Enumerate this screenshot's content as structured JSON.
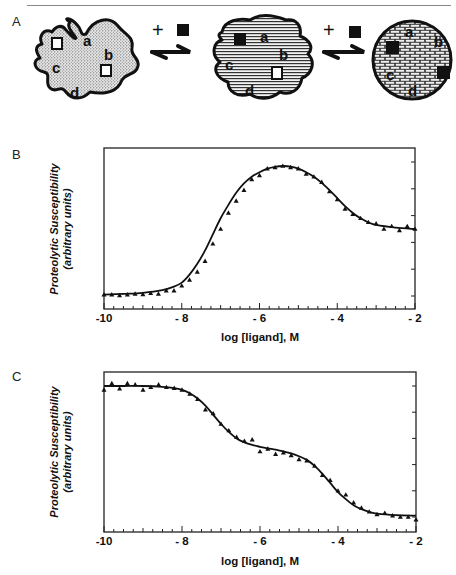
{
  "figure": {
    "panels": {
      "A": {
        "label": "A",
        "plus_sign": "+",
        "states": [
          {
            "name": "unliganded",
            "fill": "stipple",
            "sites": [
              "a",
              "b",
              "c",
              "d"
            ],
            "bound": 0
          },
          {
            "name": "partially-liganded",
            "fill": "horizontal-lines",
            "sites": [
              "a",
              "b",
              "c",
              "d"
            ],
            "bound": 1
          },
          {
            "name": "fully-liganded",
            "fill": "brick",
            "sites": [
              "a",
              "b",
              "c",
              "d"
            ],
            "bound": 2
          }
        ]
      },
      "B": {
        "label": "B"
      },
      "C": {
        "label": "C"
      }
    }
  },
  "chart_data": [
    {
      "panel": "B",
      "type": "line",
      "title": "",
      "xlabel": "log [ligand], M",
      "ylabel": "Proteolytic Susceptibility",
      "ylabel_sub": "(arbitrary units)",
      "xlim": [
        -10,
        -2
      ],
      "ylim": [
        -0.3,
        5.5
      ],
      "x_ticks": [
        "-10",
        "- 8",
        "- 6",
        "- 4",
        "- 2"
      ],
      "y_ticks_unlabeled": [
        0,
        1,
        2,
        3,
        4,
        5
      ],
      "grid": false,
      "legend": null,
      "series": [
        {
          "name": "fit",
          "style": "solid-line",
          "x": [
            -10,
            -9.5,
            -9,
            -8.5,
            -8.2,
            -8,
            -7.8,
            -7.6,
            -7.4,
            -7.2,
            -7,
            -6.8,
            -6.6,
            -6.4,
            -6.2,
            -6,
            -5.8,
            -5.6,
            -5.4,
            -5.2,
            -5,
            -4.8,
            -4.6,
            -4.4,
            -4.2,
            -4,
            -3.8,
            -3.6,
            -3.4,
            -3.2,
            -3,
            -2.5,
            -2
          ],
          "y": [
            0.05,
            0.08,
            0.12,
            0.22,
            0.35,
            0.5,
            0.8,
            1.2,
            1.7,
            2.3,
            2.9,
            3.4,
            3.85,
            4.2,
            4.45,
            4.62,
            4.75,
            4.82,
            4.85,
            4.83,
            4.75,
            4.62,
            4.45,
            4.22,
            3.95,
            3.65,
            3.35,
            3.1,
            2.9,
            2.75,
            2.65,
            2.55,
            2.5
          ]
        },
        {
          "name": "data",
          "style": "triangle-markers",
          "x": [
            -10,
            -9.8,
            -9.6,
            -9.4,
            -9.2,
            -9,
            -8.8,
            -8.6,
            -8.4,
            -8.2,
            -8,
            -7.8,
            -7.6,
            -7.4,
            -7.2,
            -7,
            -6.8,
            -6.6,
            -6.4,
            -6.2,
            -6,
            -5.8,
            -5.6,
            -5.4,
            -5.2,
            -5,
            -4.8,
            -4.6,
            -4.4,
            -4.2,
            -4,
            -3.8,
            -3.6,
            -3.4,
            -3.2,
            -3,
            -2.8,
            -2.6,
            -2.4,
            -2.2,
            -2
          ],
          "y": [
            0.05,
            0.05,
            0.02,
            0.05,
            0.08,
            0.06,
            0.1,
            0.08,
            0.2,
            0.2,
            0.38,
            0.6,
            0.9,
            1.3,
            1.95,
            2.5,
            3.1,
            3.55,
            3.95,
            4.35,
            4.5,
            4.75,
            4.8,
            4.85,
            4.8,
            4.75,
            4.55,
            4.45,
            4.25,
            3.9,
            3.6,
            3.25,
            3.05,
            2.9,
            2.75,
            2.7,
            2.5,
            2.6,
            2.45,
            2.6,
            2.5
          ]
        }
      ]
    },
    {
      "panel": "C",
      "type": "line",
      "title": "",
      "xlabel": "log [ligand], M",
      "ylabel": "Proteolytic Susceptibility",
      "ylabel_sub": "(arbitrary units)",
      "xlim": [
        -10,
        -2
      ],
      "ylim": [
        -0.6,
        5.5
      ],
      "x_ticks": [
        "-10",
        "- 8",
        "- 6",
        "- 4",
        "- 2"
      ],
      "y_ticks_unlabeled": [
        0,
        1,
        2,
        3,
        4,
        5
      ],
      "grid": false,
      "legend": null,
      "series": [
        {
          "name": "fit",
          "style": "solid-line",
          "x": [
            -10,
            -9.5,
            -9,
            -8.5,
            -8.2,
            -8,
            -7.8,
            -7.6,
            -7.4,
            -7.2,
            -7,
            -6.8,
            -6.6,
            -6.4,
            -6.2,
            -6,
            -5.8,
            -5.6,
            -5.4,
            -5.2,
            -5,
            -4.8,
            -4.6,
            -4.4,
            -4.2,
            -4,
            -3.8,
            -3.6,
            -3.4,
            -3.2,
            -3,
            -2.5,
            -2
          ],
          "y": [
            5.0,
            5.0,
            5.0,
            4.97,
            4.92,
            4.85,
            4.72,
            4.52,
            4.25,
            3.9,
            3.55,
            3.25,
            3.0,
            2.85,
            2.75,
            2.68,
            2.62,
            2.57,
            2.5,
            2.43,
            2.32,
            2.18,
            1.95,
            1.65,
            1.3,
            0.95,
            0.68,
            0.45,
            0.3,
            0.2,
            0.13,
            0.07,
            0.05
          ]
        },
        {
          "name": "data",
          "style": "triangle-markers",
          "x": [
            -10,
            -9.8,
            -9.6,
            -9.4,
            -9.2,
            -9,
            -8.8,
            -8.6,
            -8.4,
            -8.2,
            -8,
            -7.8,
            -7.6,
            -7.4,
            -7.2,
            -7,
            -6.8,
            -6.6,
            -6.4,
            -6.2,
            -6,
            -5.8,
            -5.6,
            -5.4,
            -5.2,
            -5,
            -4.8,
            -4.6,
            -4.4,
            -4.2,
            -4,
            -3.8,
            -3.6,
            -3.4,
            -3.2,
            -3,
            -2.8,
            -2.6,
            -2.4,
            -2.2,
            -2
          ],
          "y": [
            4.85,
            5.1,
            4.9,
            5.1,
            5.05,
            4.85,
            4.95,
            5.05,
            4.95,
            4.92,
            4.85,
            4.7,
            4.5,
            4.1,
            3.95,
            3.55,
            3.3,
            3.05,
            2.9,
            2.95,
            2.5,
            2.6,
            2.4,
            2.45,
            2.35,
            2.2,
            2.15,
            1.95,
            1.6,
            1.4,
            1.0,
            0.85,
            0.55,
            0.35,
            0.2,
            0.1,
            0.15,
            0.05,
            0.0,
            0.0,
            -0.1
          ]
        }
      ]
    }
  ]
}
